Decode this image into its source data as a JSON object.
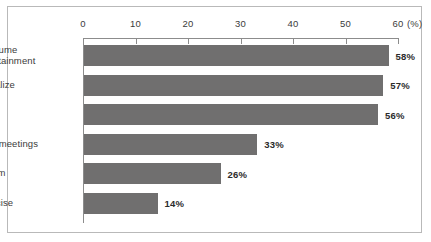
{
  "chart_data": {
    "type": "bar",
    "orientation": "horizontal",
    "title": "",
    "xlabel": "(%)",
    "ylabel": "",
    "categories": [
      "Consume\nentertainment",
      "Socialize",
      "Work",
      "Host meetings",
      "Groom",
      "Exercise"
    ],
    "values": [
      58,
      57,
      56,
      33,
      26,
      14
    ],
    "value_labels": [
      "58%",
      "57%",
      "56%",
      "33%",
      "26%",
      "14%"
    ],
    "xlim": [
      0,
      60
    ],
    "xticks": [
      0,
      10,
      20,
      30,
      40,
      50,
      60
    ],
    "xtick_labels": [
      "0",
      "10",
      "20",
      "30",
      "40",
      "50",
      "60"
    ],
    "unit_label": "(%)",
    "grid": false,
    "legend": null,
    "colors": {
      "bar": "#706f6f",
      "axis": "#8c8c8c",
      "frame": "#b9b9b9",
      "text": "#3b3b3b",
      "value_text": "#2b2b2b",
      "background": "#ffffff"
    }
  }
}
